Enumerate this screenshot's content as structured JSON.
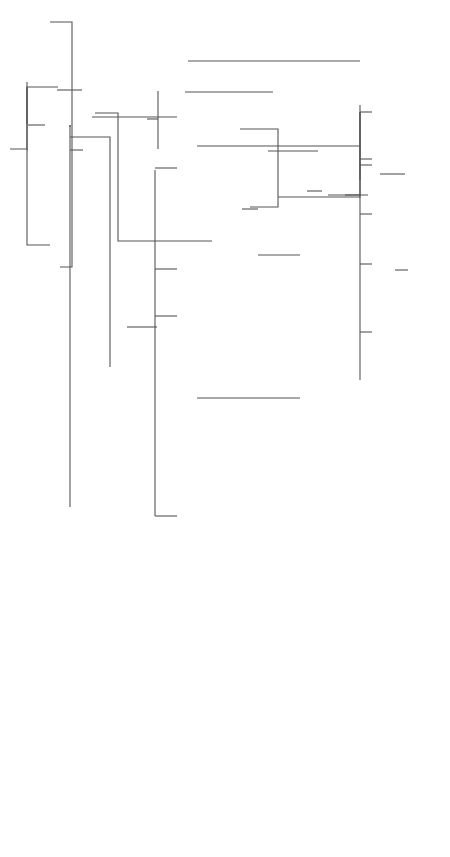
{
  "orientation": "rotated-counterclockwise",
  "people": {
    "claudius_nero": {
      "name": "Ti. Claudius Nero",
      "detail": "(pr. 42 B.C.)",
      "italic": true
    },
    "livia": {
      "name": "(1) Livia (2)",
      "detail": "(+29)",
      "italic": true
    },
    "augustus": {
      "name": "(3) AUGUSTUS",
      "detail": "(+14)",
      "italic": true
    },
    "tiberius": {
      "name": "TIBERIUS",
      "detail": "(+37)",
      "italic": true
    },
    "drusus_caesar": {
      "name": "Drusus Caesar",
      "detail": "(cos. 15, 21, +23)",
      "italic": true
    },
    "livilla": {
      "name": "Livilla",
      "detail": "",
      "italic": true
    },
    "nero_drusus": {
      "name": "Nero Claudius Drusus",
      "detail": "(cos. 9 B.C.)",
      "italic": true
    },
    "antonia": {
      "name": "Antonia the Younger",
      "detail": "",
      "italic": true
    },
    "claudius_top": {
      "name": "CLAUDIUS",
      "detail": "(+54)",
      "italic": true
    },
    "germanicus": {
      "name": "Germanicus",
      "detail": "(cos. 12, 18, +19)",
      "italic": true
    },
    "agrippina_elder": {
      "name": "Agrippina the Elder",
      "detail": "(+33)",
      "italic": true
    },
    "agrippa": {
      "name": "M. Vipsanius Agrippa",
      "detail": "(cos. 37, 28, 27 B.C.)",
      "italic": true
    },
    "julia_elder": {
      "name": "Julia the Elder",
      "detail": "",
      "italic": true
    },
    "julia_younger": {
      "name": "Julia the Younger",
      "detail": "(+28)",
      "italic": true
    },
    "aemilius_paullus": {
      "name": "L. Aemilius Paullus",
      "detail": "(cos. 1)",
      "italic": false
    },
    "nero_caesar": {
      "name": "Nero Caesar",
      "detail": "(+31)",
      "italic": true
    },
    "julia": {
      "name": "(1) Julia (2)",
      "detail": "",
      "italic": false
    },
    "rubellius_blandus": {
      "name": "C. Rubellius Blandus",
      "detail": "(cos. 18)",
      "italic": false
    },
    "rubellius_plautus": {
      "name": "C. Rubellius Plautus",
      "detail": "(+62)",
      "italic": false
    },
    "poppaeus_sabinus": {
      "name": "C. Poppaeus Sabinus",
      "detail": "(cos. 9)",
      "italic": false
    },
    "t_ollius": {
      "name": "T. Ollius",
      "detail": "",
      "italic": false
    },
    "poppaea_sabina_mother": {
      "name": "(1) Poppaea Sabina (2)",
      "detail": "",
      "italic": false
    },
    "lentulus_scipio": {
      "name": "P. Lentulus Scipio",
      "detail": "(cos. 24)",
      "italic": false
    },
    "poppaea_sabina": {
      "name": "(3) Poppaea Sabina",
      "detail": "",
      "italic": false
    },
    "rufrius_crispinus": {
      "name": "(1) = Rufrius Crispinus",
      "detail": "(+66)",
      "italic": false
    },
    "otho": {
      "name": "(2) = OTHO",
      "detail": "(+69)",
      "italic": false
    },
    "claudia_augusta": {
      "name": "Claudia Augusta",
      "detail": "(+63)",
      "italic": false
    },
    "agrippina_younger": {
      "name": "(4) = Agrippina the Younger (1)",
      "detail": "",
      "italic": true
    },
    "domitius": {
      "name": "Cn. Domitius Ahenobarbus",
      "detail": "(cos. 32)",
      "italic": true
    },
    "claudius_mid": {
      "name": "CLAUDIUS",
      "detail": "(+54)",
      "italic": true
    },
    "messalina": {
      "name": "(3) = Valeria Messalina",
      "detail": "",
      "italic": true
    },
    "nero": {
      "name": "(1) NERO (2)",
      "detail": "(+68)",
      "italic": true
    },
    "octavia": {
      "name": "Octavia",
      "detail": "(+62)",
      "italic": false
    },
    "britannicus": {
      "name": "Britannicus",
      "detail": "(+55)",
      "italic": false
    },
    "plautia": {
      "name": "Plautia Urgulanilla = (1)",
      "detail": "",
      "italic": false
    },
    "aelia": {
      "name": "Aelia Paetina = (2)",
      "detail": "",
      "italic": false
    },
    "claudia_antonia": {
      "name": "Claudia Antonia",
      "detail": "",
      "italic": false
    },
    "caligula": {
      "name": "GAIUS (CALIGULA)",
      "detail": "(+41)",
      "italic": true
    },
    "caesonia": {
      "name": "(4) = Caesonia",
      "detail": "",
      "italic": false
    },
    "lollia": {
      "name": "(3) = Lollia Paulina",
      "detail": "",
      "italic": false
    },
    "junia_claudia": {
      "name": "Junia Claudia = (1)",
      "detail": "(Claudilla)",
      "italic": false
    },
    "livia_cornelia": {
      "name": "Livia Cornelia = (2)",
      "detail": "",
      "italic": false
    },
    "faustus_sulla": {
      "name": "Faustus Sulla",
      "detail": "(cos. 31)",
      "italic": false
    },
    "domitia_lepida": {
      "name": "(2) Domitia Lepida",
      "detail": "",
      "italic": true
    },
    "sulla_felix": {
      "name": "L. Sulla Felix",
      "detail": "(cos. 33)",
      "italic": false
    },
    "faustus_cornelius": {
      "name": "Faustus Cornelius Sulla Felix",
      "detail": "(cos. 52, +62)",
      "italic": false
    },
    "m_junius_silanus_cos15": {
      "name": "M. Junius Silanus",
      "detail": "(cos. 15)",
      "italic": true
    },
    "junia_silana": {
      "name": "Junia Silana",
      "detail": "",
      "italic": false
    },
    "c_silius": {
      "name": "C. Silius",
      "detail": "(cos. des. 48)",
      "italic": false
    },
    "m_junius_torquatus": {
      "name": "M. Junius Silanus Torquatus",
      "detail": "(cos. 19)",
      "italic": false
    },
    "aemilia_lepida": {
      "name": "Aemilia Lepida",
      "detail": "",
      "italic": false
    },
    "junia_calvina": {
      "name": "Junia Calvina",
      "detail": "",
      "italic": false
    },
    "cassius_longinus": {
      "name": "C. Cassius Longinus",
      "detail": "(cos. 30)",
      "italic": false
    },
    "junia_lepida": {
      "name": "Junia Lepida",
      "detail": "",
      "italic": false
    },
    "m_jun_silanus": {
      "name": "M. Jun. Silanus",
      "detail": "(cos. 46, +54)",
      "italic": false
    },
    "l_jun_silanus": {
      "name": "L. Jun. Silanus",
      "detail": "(+48)",
      "italic": false
    },
    "d_jun_silanus": {
      "name": "D. Jun. Silanus",
      "detail": "(cos. 53, +64)",
      "italic": false
    },
    "l_silanus_torquatus": {
      "name": "L. Silanus Torquatus",
      "detail": "(+65)",
      "italic": false
    },
    "p_vitellius": {
      "name": "P. Vitellius",
      "detail": "",
      "italic": false
    },
    "l_vitellius_elder": {
      "name": "L. Vitellius",
      "detail": "(cos. 34, 43, 47)",
      "italic": false
    },
    "l_vitellius": {
      "name": "L. Vitellius",
      "detail": "(cos. 48)",
      "italic": false
    },
    "a_vitellius": {
      "name": "A. VITELLIUS",
      "detail": "(cos. 48)",
      "italic": false
    }
  },
  "marriage_sign": "="
}
